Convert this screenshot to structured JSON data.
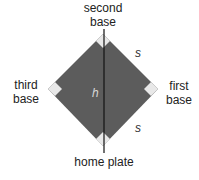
{
  "diagram": {
    "labels": {
      "second_base": [
        "second",
        "base"
      ],
      "third_base": [
        "third",
        "base"
      ],
      "first_base": [
        "first",
        "base"
      ],
      "home_plate": "home plate"
    },
    "variables": {
      "side": "s",
      "side_lower": "s",
      "diagonal": "h"
    },
    "colors": {
      "field": "#5c5c5c",
      "base": "#e8e8e8",
      "diagonal_line": "#111111",
      "text": "#222222"
    }
  }
}
